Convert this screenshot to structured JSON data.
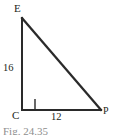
{
  "figure": {
    "type": "right-triangle-diagram",
    "background_color": "#ffffff",
    "stroke_color": "#2a2a2a",
    "text_color": "#231f20",
    "vertices": {
      "e": {
        "label": "E",
        "x": 22,
        "y": 18
      },
      "c": {
        "label": "C",
        "x": 22,
        "y": 110
      },
      "p": {
        "label": "P",
        "x": 101,
        "y": 110
      }
    },
    "side_labels": {
      "ec": "16",
      "cp": "12"
    },
    "right_angle": {
      "at_vertex": "C",
      "marker": "square",
      "size": 11
    },
    "caption_clipped": "Fig. 24.35"
  }
}
